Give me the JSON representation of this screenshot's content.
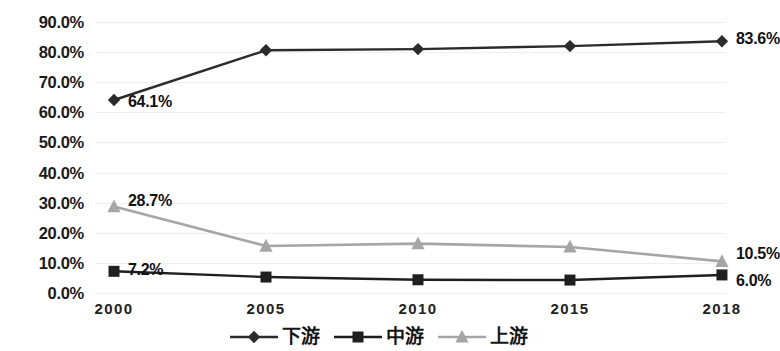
{
  "chart_data": {
    "type": "line",
    "title": "",
    "xlabel": "",
    "ylabel": "",
    "categories": [
      "2000",
      "2005",
      "2010",
      "2015",
      "2018"
    ],
    "ylim": [
      0,
      90
    ],
    "ytick_labels": [
      "0.0%",
      "10.0%",
      "20.0%",
      "30.0%",
      "40.0%",
      "50.0%",
      "60.0%",
      "70.0%",
      "80.0%",
      "90.0%"
    ],
    "ytick_values": [
      0,
      10,
      20,
      30,
      40,
      50,
      60,
      70,
      80,
      90
    ],
    "grid": true,
    "legend_position": "bottom",
    "series": [
      {
        "name": "下游",
        "marker": "diamond",
        "color": "#2b2b2b",
        "values": [
          64.1,
          80.6,
          81.0,
          82.0,
          83.6
        ],
        "labels": [
          {
            "index": 0,
            "text": "64.1%"
          },
          {
            "index": 4,
            "text": "83.6%"
          }
        ]
      },
      {
        "name": "中游",
        "marker": "square",
        "color": "#1f1f1f",
        "values": [
          7.2,
          5.3,
          4.4,
          4.3,
          6.0
        ],
        "labels": [
          {
            "index": 0,
            "text": "7.2%"
          },
          {
            "index": 4,
            "text": "6.0%"
          }
        ]
      },
      {
        "name": "上游",
        "marker": "triangle",
        "color": "#a6a6a6",
        "values": [
          28.7,
          15.6,
          16.4,
          15.3,
          10.5
        ],
        "labels": [
          {
            "index": 0,
            "text": "28.7%"
          },
          {
            "index": 4,
            "text": "10.5%"
          }
        ]
      }
    ]
  },
  "axis": {
    "y_labels": [
      "90.0%",
      "80.0%",
      "70.0%",
      "60.0%",
      "50.0%",
      "40.0%",
      "30.0%",
      "20.0%",
      "10.0%",
      "0.0%"
    ],
    "x_labels": [
      "2000",
      "2005",
      "2010",
      "2015",
      "2018"
    ]
  },
  "legend": {
    "items": [
      {
        "label": "下游",
        "marker": "diamond",
        "color": "#2b2b2b"
      },
      {
        "label": "中游",
        "marker": "square",
        "color": "#1f1f1f"
      },
      {
        "label": "上游",
        "marker": "triangle",
        "color": "#a6a6a6"
      }
    ]
  }
}
